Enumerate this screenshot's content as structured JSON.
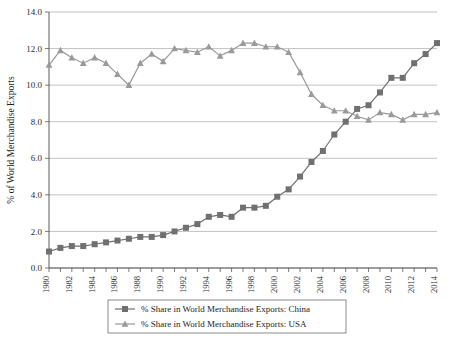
{
  "chart_data": {
    "type": "line",
    "title": "",
    "xlabel": "",
    "ylabel": "% of World Merchandise Exports",
    "ylim": [
      0.0,
      14.0
    ],
    "xlim": [
      1980,
      2014
    ],
    "ytick_step": 2.0,
    "ytick_labels": [
      "0.0",
      "2.0",
      "4.0",
      "6.0",
      "8.0",
      "10.0",
      "12.0",
      "14.0"
    ],
    "ytick_values": [
      0.0,
      2.0,
      4.0,
      6.0,
      8.0,
      10.0,
      12.0,
      14.0
    ],
    "x": [
      1980,
      1981,
      1982,
      1983,
      1984,
      1985,
      1986,
      1987,
      1988,
      1989,
      1990,
      1991,
      1992,
      1993,
      1994,
      1995,
      1996,
      1997,
      1998,
      1999,
      2000,
      2001,
      2002,
      2003,
      2004,
      2005,
      2006,
      2007,
      2008,
      2009,
      2010,
      2011,
      2012,
      2013,
      2014
    ],
    "xtick_labels": [
      "1980",
      "1982",
      "1984",
      "1986",
      "1988",
      "1990",
      "1992",
      "1994",
      "1996",
      "1998",
      "2000",
      "2002",
      "2004",
      "2006",
      "2008",
      "2010",
      "2012",
      "2014"
    ],
    "xtick_values": [
      1980,
      1982,
      1984,
      1986,
      1988,
      1990,
      1992,
      1994,
      1996,
      1998,
      2000,
      2002,
      2004,
      2006,
      2008,
      2010,
      2012,
      2014
    ],
    "grid": true,
    "legend_position": "below",
    "series": [
      {
        "name": "% Share in World Merchandise Exports: China",
        "marker": "square",
        "color": "#707070",
        "values": [
          0.9,
          1.1,
          1.2,
          1.2,
          1.3,
          1.4,
          1.5,
          1.6,
          1.7,
          1.7,
          1.8,
          2.0,
          2.2,
          2.4,
          2.8,
          2.9,
          2.8,
          3.3,
          3.3,
          3.4,
          3.9,
          4.3,
          5.0,
          5.8,
          6.4,
          7.3,
          8.0,
          8.7,
          8.9,
          9.6,
          10.4,
          10.4,
          11.2,
          11.7,
          12.3
        ]
      },
      {
        "name": "% Share in World Merchandise Exports: USA",
        "marker": "triangle",
        "color": "#9a9a9a",
        "values": [
          11.1,
          11.9,
          11.5,
          11.2,
          11.5,
          11.2,
          10.6,
          10.0,
          11.2,
          11.7,
          11.3,
          12.0,
          11.9,
          11.8,
          12.1,
          11.6,
          11.9,
          12.3,
          12.3,
          12.1,
          12.1,
          11.8,
          10.7,
          9.5,
          8.9,
          8.6,
          8.6,
          8.3,
          8.1,
          8.5,
          8.4,
          8.1,
          8.4,
          8.4,
          8.5
        ]
      }
    ]
  },
  "legend": {
    "entries": [
      {
        "label": "% Share in World Merchandise Exports: China"
      },
      {
        "label": "% Share in World Merchandise Exports: USA"
      }
    ]
  }
}
